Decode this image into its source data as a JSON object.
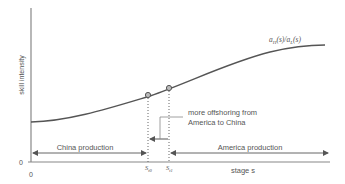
{
  "diagram": {
    "y_axis_label": "skill intensity",
    "x_axis_label": "stage s",
    "origin_y": "0",
    "origin_x": "0",
    "curve_label": "a_H(s)/a_L(s)",
    "curve_label_parts": {
      "a1": "a",
      "sub1": "H",
      "mid": "(s)/",
      "a2": "a",
      "sub2": "L",
      "end": "(s)"
    },
    "marker0_label": "S",
    "marker0_sub": "t0",
    "marker1_label": "S",
    "marker1_sub": "t1",
    "annotation_line1": "more offshoring from",
    "annotation_line2": "America to China",
    "region_left_label": "China production",
    "region_right_label": "America production",
    "colors": {
      "axis": "#888888",
      "curve": "#555555",
      "text": "#555555",
      "marker_fill": "#bbbbbb"
    }
  }
}
